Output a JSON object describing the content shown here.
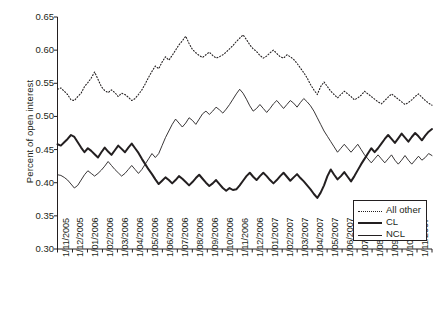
{
  "chart_data": {
    "type": "line",
    "title": "",
    "xlabel": "",
    "ylabel": "Percent of open interest",
    "ylim": [
      0.3,
      0.65
    ],
    "yticks": [
      "0.30",
      "0.35",
      "0.40",
      "0.45",
      "0.50",
      "0.55",
      "0.60",
      "0.65"
    ],
    "ytick_values": [
      0.3,
      0.35,
      0.4,
      0.45,
      0.5,
      0.55,
      0.6,
      0.65
    ],
    "grid": false,
    "legend_position": "lower-right",
    "categories": [
      "1/11/2005",
      "1/12/2005",
      "1/01/2006",
      "1/02/2006",
      "1/03/2006",
      "1/04/2006",
      "1/05/2006",
      "1/06/2006",
      "1/07/2006",
      "1/08/2006",
      "1/09/2006",
      "1/10/2006",
      "1/11/2006",
      "1/12/2006",
      "1/01/2007",
      "1/02/2007",
      "1/03/2007",
      "1/04/2007",
      "1/05/2007",
      "1/06/2007",
      "1/07/2007",
      "1/08/2007",
      "1/09/2007",
      "1/10/2007",
      "1/11/2007",
      "1/12/2007"
    ],
    "series": [
      {
        "name": "All other",
        "style": "dotted",
        "values": [
          0.541,
          0.537,
          0.524,
          0.535,
          0.556,
          0.543,
          0.536,
          0.53,
          0.523,
          0.545,
          0.572,
          0.59,
          0.583,
          0.615,
          0.6,
          0.596,
          0.609,
          0.598,
          0.603,
          0.59,
          0.577,
          0.56,
          0.54,
          0.528,
          0.52,
          0.517
        ],
        "values_weekly": [
          0.541,
          0.543,
          0.538,
          0.533,
          0.525,
          0.524,
          0.53,
          0.535,
          0.545,
          0.551,
          0.558,
          0.567,
          0.556,
          0.545,
          0.539,
          0.536,
          0.54,
          0.536,
          0.53,
          0.535,
          0.533,
          0.529,
          0.524,
          0.527,
          0.533,
          0.54,
          0.549,
          0.559,
          0.568,
          0.576,
          0.572,
          0.582,
          0.59,
          0.585,
          0.592,
          0.6,
          0.608,
          0.614,
          0.621,
          0.61,
          0.601,
          0.596,
          0.592,
          0.589,
          0.593,
          0.597,
          0.592,
          0.588,
          0.59,
          0.593,
          0.597,
          0.602,
          0.607,
          0.613,
          0.618,
          0.623,
          0.616,
          0.608,
          0.602,
          0.598,
          0.592,
          0.588,
          0.591,
          0.596,
          0.6,
          0.595,
          0.59,
          0.588,
          0.593,
          0.59,
          0.586,
          0.58,
          0.573,
          0.566,
          0.558,
          0.548,
          0.54,
          0.533,
          0.545,
          0.552,
          0.545,
          0.538,
          0.533,
          0.528,
          0.533,
          0.538,
          0.534,
          0.53,
          0.525,
          0.528,
          0.532,
          0.538,
          0.534,
          0.53,
          0.526,
          0.522,
          0.519,
          0.524,
          0.529,
          0.534,
          0.53,
          0.526,
          0.522,
          0.518,
          0.521,
          0.525,
          0.53,
          0.534,
          0.529,
          0.524,
          0.52,
          0.517
        ]
      },
      {
        "name": "CL",
        "style": "thick-solid",
        "values": [
          0.458,
          0.47,
          0.451,
          0.447,
          0.46,
          0.452,
          0.414,
          0.404,
          0.399,
          0.413,
          0.398,
          0.406,
          0.411,
          0.406,
          0.396,
          0.385,
          0.419,
          0.437,
          0.455,
          0.462,
          0.47,
          0.467,
          0.474,
          0.468,
          0.476,
          0.48
        ],
        "values_weekly": [
          0.458,
          0.456,
          0.461,
          0.466,
          0.472,
          0.469,
          0.461,
          0.453,
          0.446,
          0.452,
          0.448,
          0.443,
          0.438,
          0.446,
          0.453,
          0.447,
          0.442,
          0.449,
          0.456,
          0.451,
          0.446,
          0.453,
          0.459,
          0.452,
          0.445,
          0.436,
          0.428,
          0.42,
          0.413,
          0.405,
          0.398,
          0.403,
          0.408,
          0.404,
          0.399,
          0.404,
          0.41,
          0.406,
          0.401,
          0.396,
          0.401,
          0.407,
          0.412,
          0.406,
          0.4,
          0.395,
          0.399,
          0.404,
          0.398,
          0.392,
          0.388,
          0.392,
          0.389,
          0.39,
          0.396,
          0.403,
          0.41,
          0.415,
          0.409,
          0.404,
          0.41,
          0.415,
          0.41,
          0.404,
          0.399,
          0.404,
          0.41,
          0.415,
          0.409,
          0.403,
          0.408,
          0.413,
          0.407,
          0.402,
          0.396,
          0.39,
          0.383,
          0.377,
          0.385,
          0.396,
          0.41,
          0.42,
          0.412,
          0.405,
          0.41,
          0.416,
          0.409,
          0.402,
          0.41,
          0.419,
          0.428,
          0.436,
          0.444,
          0.452,
          0.446,
          0.452,
          0.459,
          0.466,
          0.472,
          0.466,
          0.46,
          0.467,
          0.474,
          0.468,
          0.462,
          0.469,
          0.475,
          0.47,
          0.464,
          0.471,
          0.477,
          0.481
        ]
      },
      {
        "name": "NCL",
        "style": "thin-solid",
        "values": [
          0.412,
          0.396,
          0.41,
          0.412,
          0.418,
          0.43,
          0.455,
          0.48,
          0.495,
          0.505,
          0.512,
          0.52,
          0.53,
          0.54,
          0.525,
          0.51,
          0.47,
          0.455,
          0.45,
          0.443,
          0.438,
          0.444,
          0.432,
          0.44,
          0.438,
          0.441
        ],
        "values_weekly": [
          0.412,
          0.411,
          0.408,
          0.404,
          0.398,
          0.392,
          0.396,
          0.404,
          0.412,
          0.418,
          0.414,
          0.41,
          0.414,
          0.419,
          0.425,
          0.432,
          0.426,
          0.42,
          0.415,
          0.41,
          0.414,
          0.42,
          0.426,
          0.42,
          0.414,
          0.42,
          0.428,
          0.436,
          0.444,
          0.438,
          0.444,
          0.456,
          0.468,
          0.478,
          0.488,
          0.496,
          0.49,
          0.484,
          0.49,
          0.498,
          0.494,
          0.488,
          0.496,
          0.504,
          0.508,
          0.503,
          0.508,
          0.514,
          0.51,
          0.505,
          0.511,
          0.518,
          0.526,
          0.534,
          0.541,
          0.535,
          0.526,
          0.516,
          0.508,
          0.512,
          0.518,
          0.512,
          0.506,
          0.512,
          0.519,
          0.524,
          0.518,
          0.512,
          0.518,
          0.524,
          0.52,
          0.514,
          0.521,
          0.527,
          0.522,
          0.516,
          0.508,
          0.498,
          0.488,
          0.478,
          0.47,
          0.462,
          0.454,
          0.446,
          0.452,
          0.458,
          0.452,
          0.446,
          0.452,
          0.458,
          0.45,
          0.442,
          0.436,
          0.43,
          0.436,
          0.442,
          0.436,
          0.43,
          0.436,
          0.442,
          0.434,
          0.428,
          0.434,
          0.441,
          0.434,
          0.428,
          0.434,
          0.44,
          0.434,
          0.438,
          0.444,
          0.441
        ]
      }
    ]
  },
  "axis": {
    "ylabel": "Percent of open interest",
    "yticks": [
      "0.65",
      "0.60",
      "0.55",
      "0.50",
      "0.45",
      "0.40",
      "0.35",
      "0.30"
    ]
  },
  "legend": {
    "items": [
      {
        "label": "All other",
        "style": "dotted"
      },
      {
        "label": "CL",
        "style": "thick"
      },
      {
        "label": "NCL",
        "style": "thin"
      }
    ]
  },
  "xlabels": [
    "1/11/2005",
    "1/12/2005",
    "1/01/2006",
    "1/02/2006",
    "1/03/2006",
    "1/04/2006",
    "1/05/2006",
    "1/06/2006",
    "1/07/2006",
    "1/08/2006",
    "1/09/2006",
    "1/10/2006",
    "1/11/2006",
    "1/12/2006",
    "1/01/2007",
    "1/02/2007",
    "1/03/2007",
    "1/04/2007",
    "1/05/2007",
    "1/06/2007",
    "1/07/2007",
    "1/08/2007",
    "1/09/2007",
    "1/10/2007",
    "1/11/2007",
    "1/12/2007"
  ],
  "colors": {
    "ink": "#231f20",
    "background": "#ffffff"
  }
}
